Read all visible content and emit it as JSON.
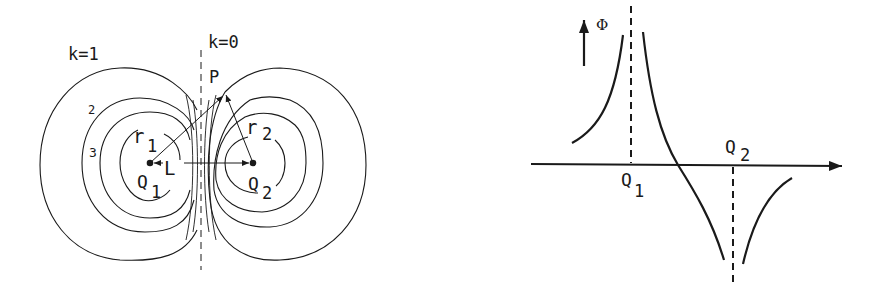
{
  "left_panel": {
    "title": "Equipotential lines of two point charges",
    "labels": {
      "k1": "k=1",
      "k0": "k=0",
      "two": "2",
      "three": "3",
      "P": "P",
      "r1_main": "r",
      "r1_sub": "1",
      "r2_main": "r",
      "r2_sub": "2",
      "L": "L",
      "Q1_main": "Q",
      "Q1_sub": "1",
      "Q2_main": "Q",
      "Q2_sub": "2"
    }
  },
  "right_panel": {
    "labels": {
      "phi": "Φ",
      "Q1_main": "Q",
      "Q1_sub": "1",
      "Q2_main": "Q",
      "Q2_sub": "2"
    }
  },
  "colors": {
    "ink": "#1a1a1a",
    "background": "#ffffff"
  }
}
